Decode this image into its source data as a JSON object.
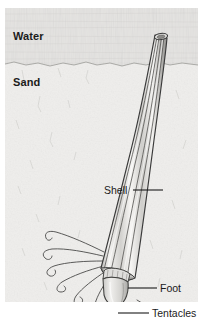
{
  "figure": {
    "panel": {
      "x": 5,
      "y": 8,
      "width": 193,
      "height": 294
    },
    "colors": {
      "water_fill": "#e4e3e1",
      "sand_fill": "#efeeec",
      "shell_light": "#f6f5f3",
      "shell_mid": "#d9d8d6",
      "shell_dark": "#9a9996",
      "outline": "#3a3a3a",
      "label_text": "#1b1b1b",
      "leader_line": "#1b1b1b",
      "background": "#ffffff"
    },
    "zones": [
      {
        "name": "water",
        "label": "Water",
        "label_x": 13,
        "label_y": 30
      },
      {
        "name": "sand",
        "label": "Sand",
        "label_x": 13,
        "label_y": 76
      }
    ],
    "seafloor_y": 64,
    "callouts": [
      {
        "name": "shell",
        "label": "Shell",
        "label_x": 104,
        "label_y": 184,
        "leader_from_x": 133,
        "leader_from_y": 190,
        "leader_to_x": 163,
        "leader_to_y": 190
      },
      {
        "name": "foot",
        "label": "Foot",
        "label_x": 160,
        "label_y": 282,
        "leader_from_x": 128,
        "leader_from_y": 288,
        "leader_to_x": 157,
        "leader_to_y": 288
      },
      {
        "name": "tentacles",
        "label": "Tentacles",
        "label_x": 152,
        "label_y": 307,
        "leader_from_x": 118,
        "leader_from_y": 313,
        "leader_to_x": 149,
        "leader_to_y": 313
      }
    ],
    "organism": {
      "name": "tusk-shell",
      "parts": [
        "shell",
        "aperture-opening",
        "foot",
        "tentacles"
      ],
      "tentacle_count": 7,
      "shell_rib_count": 5
    }
  }
}
